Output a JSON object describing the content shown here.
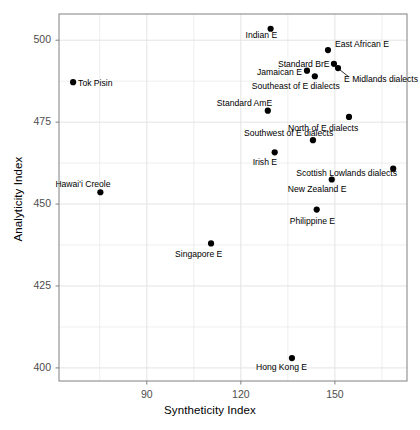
{
  "chart_data": {
    "type": "scatter",
    "title": "",
    "xlabel": "Syntheticity Index",
    "ylabel": "Analyticity Index",
    "xlim": [
      62,
      173
    ],
    "ylim": [
      396,
      508
    ],
    "xticks": [
      90,
      120,
      150
    ],
    "yticks": [
      400,
      425,
      450,
      475,
      500
    ],
    "grid": true,
    "minor_grid": true,
    "legend": "none",
    "point_color": "#000000",
    "grid_color": "#e3e3e3",
    "panel_border_color": "#808080",
    "points": [
      {
        "label": "Indian E",
        "x": 129.5,
        "y": 503.5,
        "label_dx": -25,
        "label_dy": 6,
        "leader": false
      },
      {
        "label": "East African E",
        "x": 147.8,
        "y": 497.0,
        "label_dx": 7,
        "label_dy": -6,
        "leader": false
      },
      {
        "label": "Standard BrE",
        "x": 149.7,
        "y": 492.8,
        "label_dx": -56,
        "label_dy": 0,
        "leader": false
      },
      {
        "label": "E Midlands dialects",
        "x": 151.0,
        "y": 491.5,
        "label_dx": 6,
        "label_dy": 11,
        "leader": true,
        "leader_x2": 6,
        "leader_y2": 9
      },
      {
        "label": "Jamaican E",
        "x": 141.1,
        "y": 490.7,
        "label_dx": -50,
        "label_dy": 1,
        "leader": false
      },
      {
        "label": "Southeast of E dialects",
        "x": 143.6,
        "y": 489.0,
        "label_dx": -63,
        "label_dy": 10,
        "leader": false
      },
      {
        "label": "Tok Pisin",
        "x": 66.5,
        "y": 487.2,
        "label_dx": 5,
        "label_dy": 1,
        "leader": false
      },
      {
        "label": "Standard AmE",
        "x": 128.6,
        "y": 478.5,
        "label_dx": -51,
        "label_dy": -8,
        "leader": false
      },
      {
        "label": "North of E dialects",
        "x": 154.5,
        "y": 476.6,
        "label_dx": -61,
        "label_dy": 11,
        "leader": false
      },
      {
        "label": "Southwest of E dialects",
        "x": 143.0,
        "y": 469.5,
        "label_dx": -69,
        "label_dy": -7,
        "leader": false
      },
      {
        "label": "Irish E",
        "x": 130.8,
        "y": 465.8,
        "label_dx": -22,
        "label_dy": 10,
        "leader": false
      },
      {
        "label": "Scottish Lowlands dialects",
        "x": 168.6,
        "y": 460.8,
        "label_dx": -97,
        "label_dy": 4,
        "leader": false
      },
      {
        "label": "New Zealand E",
        "x": 149.0,
        "y": 457.5,
        "label_dx": -44,
        "label_dy": 10,
        "leader": false
      },
      {
        "label": "Hawai'i Creole",
        "x": 75.2,
        "y": 453.6,
        "label_dx": -45,
        "label_dy": -8,
        "leader": false
      },
      {
        "label": "Philippine E",
        "x": 144.2,
        "y": 448.3,
        "label_dx": -27,
        "label_dy": 11,
        "leader": false
      },
      {
        "label": "Singapore E",
        "x": 110.5,
        "y": 438.0,
        "label_dx": -36,
        "label_dy": 11,
        "leader": false
      },
      {
        "label": "Hong Kong E",
        "x": 136.3,
        "y": 403.0,
        "label_dx": -36,
        "label_dy": 9,
        "leader": false
      }
    ]
  }
}
